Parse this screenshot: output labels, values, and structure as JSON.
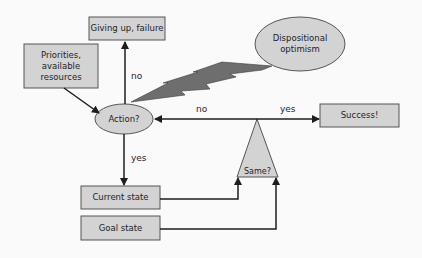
{
  "diagram": {
    "nodes": {
      "giving_up": {
        "label": "Giving up, failure",
        "shape": "rect"
      },
      "priorities": {
        "label_lines": [
          "Priorities,",
          "available",
          "resources"
        ],
        "shape": "rect"
      },
      "action": {
        "label": "Action?",
        "shape": "ellipse"
      },
      "optimism": {
        "label_lines": [
          "Dispositional",
          "optimism"
        ],
        "shape": "ellipse"
      },
      "success": {
        "label": "Success!",
        "shape": "rect"
      },
      "same": {
        "label": "Same?",
        "shape": "triangle"
      },
      "current_state": {
        "label": "Current state",
        "shape": "rect"
      },
      "goal_state": {
        "label": "Goal state",
        "shape": "rect"
      }
    },
    "edges": {
      "action_to_giving_up": {
        "label": "no"
      },
      "same_to_action": {
        "label": "no"
      },
      "same_to_success": {
        "label": "yes"
      },
      "action_to_current_state": {
        "label": "yes"
      },
      "priorities_to_action": {
        "label": ""
      },
      "current_state_to_same": {
        "label": ""
      },
      "goal_state_to_same": {
        "label": ""
      },
      "optimism_to_action": {
        "label": "",
        "style": "lightning-bolt"
      }
    },
    "colors": {
      "node_fill": "#d3d3d3",
      "node_stroke": "#555555",
      "line": "#1e1e1e",
      "bolt": "#6e6e6e",
      "background": "#fafafa"
    }
  }
}
